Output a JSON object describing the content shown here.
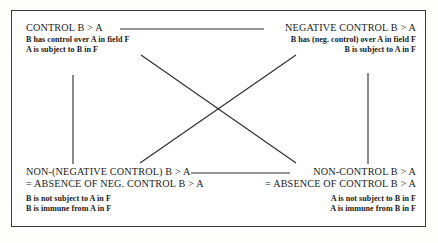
{
  "diagram": {
    "frame": {
      "border_color": "#3a3a3a",
      "background": "#ffffff"
    },
    "line_color": "#2b2b2b",
    "corners": {
      "top_left": {
        "heading": "CONTROL B > A",
        "details": [
          "B has control over A in field F",
          "A is subject to B in F"
        ]
      },
      "top_right": {
        "heading": "NEGATIVE CONTROL B > A",
        "details": [
          "B has (neg. control) over A in field F",
          "B is subject to A in F"
        ]
      },
      "bottom_left": {
        "heading": "NON-(NEGATIVE CONTROL) B > A",
        "heading2": "= ABSENCE OF NEG. CONTROL B > A",
        "details": [
          "B is not subject to A in F",
          "B is immune from A in F"
        ]
      },
      "bottom_right": {
        "heading": "NON-CONTROL B > A",
        "heading2": "= ABSENCE OF CONTROL B > A",
        "details": [
          "A is not subject to B in F",
          "A is immune from B in F"
        ]
      }
    },
    "connectors": [
      {
        "name": "top-horizontal-connector",
        "from": "top_left",
        "to": "top_right",
        "x1": 120,
        "y1": 29,
        "x2": 264,
        "y2": 29
      },
      {
        "name": "bottom-horizontal-connector",
        "from": "bottom_left",
        "to": "bottom_right",
        "x1": 191,
        "y1": 173,
        "x2": 290,
        "y2": 173
      },
      {
        "name": "left-vertical-connector",
        "from": "top_left",
        "to": "bottom_left",
        "x1": 73,
        "y1": 75,
        "x2": 73,
        "y2": 164
      },
      {
        "name": "right-vertical-connector",
        "from": "top_right",
        "to": "bottom_right",
        "x1": 368,
        "y1": 73,
        "x2": 368,
        "y2": 164
      },
      {
        "name": "diagonal-top-left-to-bottom-right",
        "from": "top_left",
        "to": "bottom_right",
        "x1": 141,
        "y1": 55,
        "x2": 296,
        "y2": 163
      },
      {
        "name": "diagonal-top-right-to-bottom-left",
        "from": "top_right",
        "to": "bottom_left",
        "x1": 296,
        "y1": 55,
        "x2": 140,
        "y2": 163
      }
    ]
  }
}
